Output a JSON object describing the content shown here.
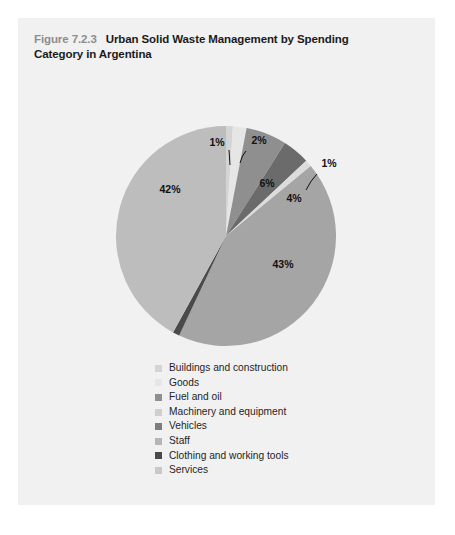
{
  "figure": {
    "number_label": "Figure 7.2.3",
    "title_line1": "Urban Solid Waste Management by Spending",
    "title_line2": "Category in Argentina"
  },
  "colors": {
    "page_background": "#ffffff",
    "card_background": "#f1f1f1",
    "figure_number": "#8d8d8d",
    "title_text": "#1b1b1b",
    "legend_text": "#1f1f1f",
    "label_text": "#111111",
    "leader_line": "#111111"
  },
  "chart_data": {
    "type": "pie",
    "title": "Urban Solid Waste Management by Spending Category in Argentina",
    "subtitle": "",
    "xlabel": "",
    "ylabel": "",
    "legend_position": "bottom",
    "grid": false,
    "start_angle_deg": 0,
    "direction": "clockwise",
    "unit": "%",
    "categories": [
      "Buildings and construction",
      "Goods",
      "Fuel and oil",
      "Machinery and equipment",
      "Vehicles",
      "Staff",
      "Clothing and working tools",
      "Services"
    ],
    "values": [
      1,
      2,
      6,
      4,
      1,
      43,
      1,
      42
    ],
    "slice_colors": [
      "#d4d4d4",
      "#e6e6e6",
      "#8f8f8f",
      "#6b6b6b",
      "#dcdcdc",
      "#a5a5a5",
      "#4a4a4a",
      "#bdbdbd"
    ],
    "data_labels": [
      "1%",
      "2%",
      "6%",
      "4%",
      "1%",
      "43%",
      "1",
      "42%"
    ],
    "labels_outside": [
      true,
      true,
      false,
      false,
      true,
      false,
      true,
      false
    ],
    "legend_entries": [
      {
        "label": "Buildings and construction",
        "color": "#d4d4d4",
        "value": 1
      },
      {
        "label": "Goods",
        "color": "#e6e6e6",
        "value": 2
      },
      {
        "label": "Fuel and oil",
        "color": "#8f8f8f",
        "value": 6
      },
      {
        "label": "Machinery and equipment",
        "color": "#cfcfcf",
        "value": 4
      },
      {
        "label": "Vehicles",
        "color": "#7d7d7d",
        "value": 1
      },
      {
        "label": "Staff",
        "color": "#b5b5b5",
        "value": 43
      },
      {
        "label": "Clothing and working tools",
        "color": "#4a4a4a",
        "value": 1
      },
      {
        "label": "Services",
        "color": "#c9c9c9",
        "value": 42
      }
    ]
  },
  "callouts": {
    "c1": "1%",
    "c2": "2%",
    "c3": "6%",
    "c4": "4%",
    "c5": "1%",
    "c6": "43%",
    "c7": "1",
    "c8": "42%"
  }
}
